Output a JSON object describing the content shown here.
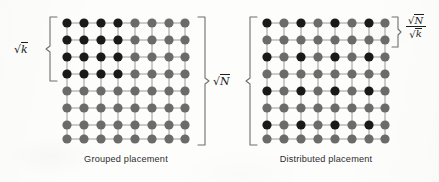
{
  "figure": {
    "background_color": "#fdfdfc",
    "node_dark_color": "#1a1a1a",
    "node_light_color": "#6b6b6b",
    "edge_color": "#9a9a9a",
    "bracket_color": "#6f6f6f"
  },
  "panels": [
    {
      "id": "grouped",
      "caption": "Grouped placement",
      "rows": 8,
      "cols": 8,
      "dark_pattern": "top-left 4x4 block",
      "dark_nodes": [
        [
          1,
          1
        ],
        [
          1,
          2
        ],
        [
          1,
          3
        ],
        [
          1,
          4
        ],
        [
          2,
          1
        ],
        [
          2,
          2
        ],
        [
          2,
          3
        ],
        [
          2,
          4
        ],
        [
          3,
          1
        ],
        [
          3,
          2
        ],
        [
          3,
          3
        ],
        [
          3,
          4
        ],
        [
          4,
          1
        ],
        [
          4,
          2
        ],
        [
          4,
          3
        ],
        [
          4,
          4
        ]
      ],
      "labels": {
        "side": {
          "text": "sqrt(k)",
          "sign": "√",
          "radicand": "k",
          "spans_rows": 4,
          "position": "left"
        }
      }
    },
    {
      "id": "distributed",
      "caption": "Distributed placement",
      "rows": 8,
      "cols": 8,
      "dark_pattern": "every other row and column (rows 1,3,5,7 x cols 1,3,5,7)",
      "dark_nodes": [
        [
          1,
          1
        ],
        [
          1,
          3
        ],
        [
          1,
          5
        ],
        [
          1,
          7
        ],
        [
          3,
          1
        ],
        [
          3,
          3
        ],
        [
          3,
          5
        ],
        [
          3,
          7
        ],
        [
          5,
          1
        ],
        [
          5,
          3
        ],
        [
          5,
          5
        ],
        [
          5,
          7
        ],
        [
          7,
          1
        ],
        [
          7,
          3
        ],
        [
          7,
          5
        ],
        [
          7,
          7
        ]
      ],
      "labels": {
        "side": {
          "text": "sqrt(N)/sqrt(k)",
          "numerator_sign": "√",
          "numerator_radicand": "N",
          "denominator_sign": "√",
          "denominator_radicand": "k",
          "spans_rows": 2,
          "position": "right"
        }
      }
    }
  ],
  "center_label": {
    "text": "sqrt(N)",
    "sign": "√",
    "radicand": "N",
    "description": "side length of full grid, bracketed on both grids"
  },
  "left_label": {
    "text": "sqrt(N)",
    "sign": "√",
    "radicand": "N",
    "description": "side length bracket on distributed grid left side"
  }
}
